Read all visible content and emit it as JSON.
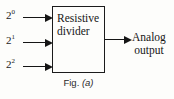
{
  "figure": {
    "caption_prefix": "Fig.",
    "caption_label": "(a)",
    "block": {
      "line1": "Resistive",
      "line2": "divider"
    },
    "inputs": [
      {
        "base": "2",
        "exponent": "0"
      },
      {
        "base": "2",
        "exponent": "1"
      },
      {
        "base": "2",
        "exponent": "2"
      }
    ],
    "output": {
      "line1": "Analog",
      "line2": "output"
    },
    "colors": {
      "background": "#fdfdfb",
      "stroke": "#1b1b1b",
      "text": "#161616"
    }
  }
}
